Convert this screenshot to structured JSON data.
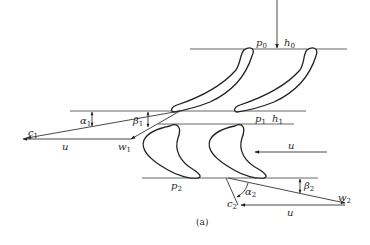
{
  "figure": {
    "caption": "(a)",
    "inlet": {
      "pressure": "p",
      "pressure_sub": "0",
      "enthalpy": "h",
      "enthalpy_sub": "0"
    },
    "stage1": {
      "pressure": "p",
      "pressure_sub": "1",
      "enthalpy": "h",
      "enthalpy_sub": "1"
    },
    "stage2": {
      "pressure": "p",
      "pressure_sub": "2"
    },
    "velocity_triangle_1": {
      "absolute": "c",
      "absolute_sub": "1",
      "relative": "w",
      "relative_sub": "1",
      "blade_speed": "u",
      "alpha": "α",
      "alpha_sub": "1",
      "beta": "β",
      "beta_sub": "1"
    },
    "rotor_motion": {
      "label": "u"
    },
    "velocity_triangle_2": {
      "absolute": "c",
      "absolute_sub": "2",
      "relative": "w",
      "relative_sub": "2",
      "blade_speed": "u",
      "alpha": "α",
      "alpha_sub": "2",
      "beta": "β",
      "beta_sub": "2"
    }
  }
}
